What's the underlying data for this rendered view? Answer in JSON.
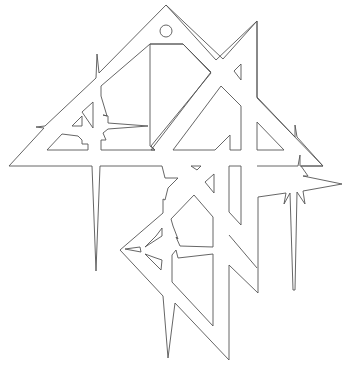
{
  "figure": {
    "width": 342,
    "height": 386,
    "background": "#ffffff",
    "stroke_color": "#555555",
    "hanging_hole": {
      "cx": 166,
      "cy": 31,
      "r": 6
    },
    "paths": [
      {
        "name": "left-big-triangle-outer",
        "d": "M166,5 L216,60 L257,21 L257,98 L323,166 L300,166 L300,155 L298,166 L257,166 L257,166 L257,166"
      },
      {
        "name": "outer-contour",
        "d": "M166,5 L223,59 L257,21 L257,97 L295,137 L295,125 L297,137 L323,166 L301,166 L308,176 L303,176 L342,184 L303,191 L305,204 L297,192 L295,290 L293,290 L290,193 L284,204 L286,193 L258,197 L258,293 L229,265 L229,360 L175,303 L168,358 L163,296 L120,250 L163,213 L163,199 L165,200 L168,188 L178,178 L165,178 L162,166 L103,166 L100,166 L96,271 L92,166 L9,166 L44,128 L36,127 L45,126 L96,78 L97,54 L99,73 Z"
      },
      {
        "name": "upper-inner-cut",
        "d": "M150,44 L183,44 L211,72 L151,150 L155,150 L150,146 Z"
      },
      {
        "name": "upper-inner-polygon",
        "d": "M150,44 L183,44 L211,73 L151,146 L155,150 L101,150 L101,140 L106,140 L103,133 L108,129 L148,126 L108,123 L108,116 L103,115 L107,116 L101,96 L101,86 Z"
      },
      {
        "name": "left-lower-cut",
        "d": "M47,150 L62,134 L78,136 L82,140 L82,144 L88,144 L88,150 Z"
      },
      {
        "name": "left-small-triangle",
        "d": "M72,126 L82,116 L82,126 Z"
      },
      {
        "name": "left-small-triangle-2",
        "d": "M82,112 L93,102 L93,128 Z"
      },
      {
        "name": "center-right-cut",
        "d": "M173,150 L221,86 L241,106 L241,150 L230,150 L230,135 L215,150 Z"
      },
      {
        "name": "upper-right-notch",
        "d": "M234,71 L241,64 L241,80 Z"
      },
      {
        "name": "right-inner-triangle",
        "d": "M257,122 L284,150 L257,150 Z"
      },
      {
        "name": "center-small-top-triangle",
        "d": "M191,166 L197,170 L201,166 Z"
      },
      {
        "name": "center-small-right-triangle",
        "d": "M205,182 L214,174 L214,193 Z"
      },
      {
        "name": "center-column-cut",
        "d": "M229,166 L241,166 L241,225 L229,212 Z"
      },
      {
        "name": "lower-left-diamond-inner",
        "d": "M194,195 L213,217 L213,247 L180,246 L176,237 L178,239 L173,226 L171,219 Z"
      },
      {
        "name": "lower-left-diamond-bottom",
        "d": "M172,255 L176,250 L178,258 L213,254 L213,326 L172,282 Z"
      },
      {
        "name": "right-lower-column",
        "d": "M229,235 L257,268"
      },
      {
        "name": "diamond-left-spike",
        "d": "M125,249 L140,247 L141,252 Z"
      },
      {
        "name": "diamond-upper-star-triangle",
        "d": "M145,247 L162,236 L162,228 L156,236 Z"
      },
      {
        "name": "diamond-lower-star-triangle",
        "d": "M145,254 L161,270 L162,260 L156,258 Z"
      }
    ]
  }
}
